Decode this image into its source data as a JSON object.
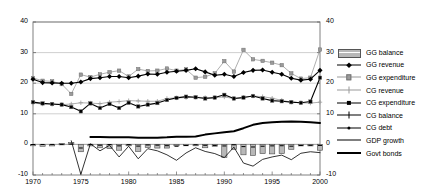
{
  "chart_data": {
    "type": "line",
    "title": "",
    "xlabel": "",
    "ylabel": "",
    "xlim": [
      1970,
      2000
    ],
    "ylim": [
      -10,
      40
    ],
    "yticks": [
      -10,
      0,
      10,
      20,
      30,
      40
    ],
    "xticks": [
      1970,
      1975,
      1980,
      1985,
      1990,
      1995,
      2000
    ],
    "grid": true,
    "dual_axis": true,
    "right_yticks": [
      -10,
      0,
      10,
      20,
      30,
      40
    ],
    "legend_position": "right",
    "x": [
      1970,
      1971,
      1972,
      1973,
      1974,
      1975,
      1976,
      1977,
      1978,
      1979,
      1980,
      1981,
      1982,
      1983,
      1984,
      1985,
      1986,
      1987,
      1988,
      1989,
      1990,
      1991,
      1992,
      1993,
      1994,
      1995,
      1996,
      1997,
      1998,
      1999,
      2000
    ],
    "series": [
      {
        "name": "GG balance",
        "type": "bar",
        "color": "#b8b8b8",
        "values": [
          -0.4,
          -0.6,
          -0.5,
          0.3,
          0.6,
          -2.4,
          -0.5,
          -1.1,
          -1.4,
          -1.9,
          -0.4,
          -2.3,
          -1.0,
          -1.2,
          -1.2,
          -0.2,
          -0.3,
          -0.3,
          -1.1,
          -0.6,
          -4.3,
          -1.6,
          -3.4,
          -3.6,
          -3.0,
          -3.1,
          -3.0,
          -1.6,
          -0.5,
          -0.5,
          -1.9
        ]
      },
      {
        "name": "GG revenue",
        "type": "line",
        "color": "#000000",
        "marker": "diamond",
        "values": [
          21.3,
          20.2,
          20.1,
          20.0,
          20.0,
          20.4,
          21.5,
          21.8,
          22.2,
          22.2,
          21.8,
          22.3,
          23.0,
          22.9,
          23.6,
          23.9,
          24.2,
          24.7,
          23.7,
          22.6,
          22.9,
          22.2,
          23.5,
          24.2,
          24.3,
          23.6,
          22.9,
          21.6,
          21.0,
          21.3,
          24.2
        ]
      },
      {
        "name": "GG expenditure",
        "type": "line",
        "color": "#9a9a9a",
        "marker": "square",
        "values": [
          21.7,
          20.8,
          20.6,
          19.7,
          16.5,
          22.8,
          22.0,
          22.9,
          23.6,
          24.1,
          22.2,
          24.6,
          24.0,
          24.1,
          24.8,
          24.1,
          24.5,
          21.8,
          22.1,
          23.2,
          27.2,
          23.8,
          30.9,
          27.8,
          27.3,
          26.7,
          25.9,
          23.2,
          21.5,
          21.8,
          31.0
        ]
      },
      {
        "name": "CG revenue",
        "type": "line",
        "color": "#9a9a9a",
        "marker": "plus",
        "values": [
          13.5,
          13.2,
          13.1,
          13.0,
          13.2,
          13.6,
          13.5,
          13.3,
          13.8,
          14.0,
          14.3,
          14.2,
          14.1,
          14.1,
          15.0,
          15.2,
          15.3,
          15.4,
          15.3,
          15.3,
          15.5,
          15.0,
          15.4,
          15.8,
          15.6,
          15.1,
          14.4,
          13.8,
          13.6,
          13.5,
          13.8
        ]
      },
      {
        "name": "CG expenditure",
        "type": "line",
        "color": "#000000",
        "marker": "square",
        "values": [
          13.8,
          13.4,
          13.2,
          13.0,
          12.2,
          10.8,
          13.4,
          11.9,
          13.2,
          11.9,
          13.6,
          12.4,
          13.0,
          13.5,
          14.5,
          15.2,
          15.6,
          15.4,
          15.0,
          15.3,
          16.2,
          15.0,
          15.3,
          15.8,
          15.0,
          14.3,
          14.1,
          13.8,
          13.6,
          14.0,
          21.8
        ]
      },
      {
        "name": "CG balance",
        "type": "line",
        "color": "#000000",
        "marker": "plus-thin",
        "values": [
          -0.3,
          -0.2,
          -0.1,
          0.0,
          1.0,
          -9.8,
          0.1,
          -2.2,
          -0.4,
          -4.0,
          -0.7,
          -4.6,
          -1.5,
          -2.0,
          -3.5,
          -5.0,
          -3.0,
          -1.0,
          -2.4,
          -2.9,
          -4.2,
          -1.0,
          -6.0,
          -7.0,
          -5.0,
          -4.0,
          -3.6,
          -4.9,
          -3.0,
          -2.5,
          -2.8
        ]
      },
      {
        "name": "CG debt",
        "type": "line",
        "color": "#000000",
        "marker": "dot",
        "values": [
          -0.3,
          -0.2,
          -0.1,
          0.0,
          1.0,
          -9.8,
          0.1,
          -2.2,
          -0.4,
          -4.0,
          -0.7,
          -4.6,
          -1.5,
          -2.0,
          -3.5,
          -5.0,
          -3.0,
          -1.0,
          -2.4,
          -2.9,
          -4.2,
          -1.0,
          -6.0,
          -7.0,
          -5.0,
          -4.0,
          -3.6,
          -4.9,
          -3.0,
          -2.5,
          -2.8
        ]
      },
      {
        "name": "GDP growth",
        "type": "line",
        "color": "#000000",
        "width": "thin",
        "values": [
          null,
          null,
          null,
          null,
          1.2,
          -9.8,
          0.2,
          -2.1,
          -0.3,
          -4.1,
          -0.6,
          -4.7,
          -1.4,
          -2.1,
          -3.4,
          -5.2,
          -2.8,
          -1.1,
          -2.3,
          -3.0,
          -4.3,
          -0.9,
          -6.1,
          -7.1,
          -4.9,
          -4.1,
          -3.5,
          -5.0,
          -2.9,
          -2.4,
          -2.7
        ]
      },
      {
        "name": "Govt bonds",
        "type": "line",
        "color": "#000000",
        "width": "thick",
        "values": [
          null,
          null,
          null,
          null,
          null,
          null,
          2.4,
          2.4,
          2.3,
          2.3,
          2.3,
          2.2,
          2.2,
          2.2,
          2.3,
          2.5,
          2.5,
          2.6,
          3.2,
          3.6,
          4.0,
          4.3,
          5.3,
          6.4,
          7.0,
          7.2,
          7.4,
          7.5,
          7.4,
          7.2,
          7.0
        ]
      }
    ]
  },
  "legend": {
    "items": [
      {
        "label": "GG balance",
        "key": "swatch"
      },
      {
        "label": "GG revenue",
        "key": "line-diamond"
      },
      {
        "label": "GG expenditure",
        "key": "line-square-grey"
      },
      {
        "label": "CG revenue",
        "key": "line-plus-grey"
      },
      {
        "label": "CG expenditure",
        "key": "line-square-black"
      },
      {
        "label": "CG balance",
        "key": "line-plus-black"
      },
      {
        "label": "CG debt",
        "key": "line-dot"
      },
      {
        "label": "GDP growth",
        "key": "line-thin"
      },
      {
        "label": "Govt bonds",
        "key": "line-thick"
      }
    ]
  },
  "axes": {
    "left_ticks": [
      "40",
      "30",
      "20",
      "10",
      "0",
      "-10"
    ],
    "right_ticks": [
      "40",
      "30",
      "20",
      "10",
      "0",
      "-10"
    ],
    "x_ticks": [
      "1970",
      "1975",
      "1980",
      "1985",
      "1990",
      "1995",
      "2000"
    ]
  }
}
